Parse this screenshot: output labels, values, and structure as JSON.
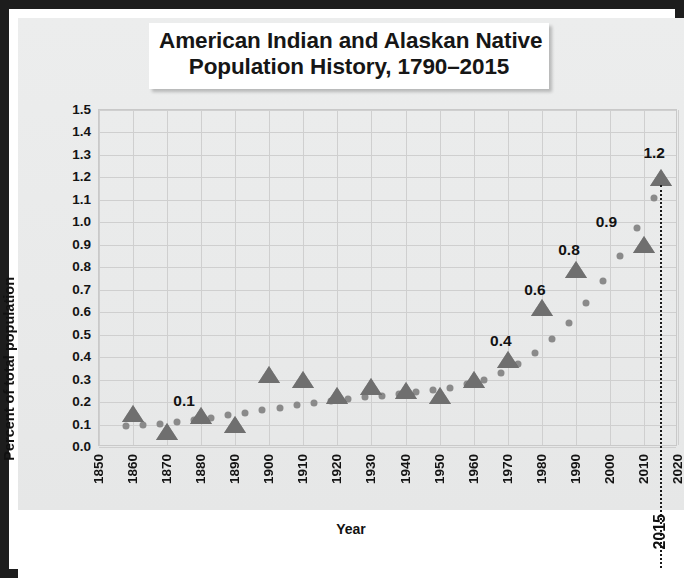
{
  "chart_data": {
    "type": "scatter",
    "title": "American Indian and Alaskan Native Population History, 1790–2015",
    "title_line1": "American Indian and Alaskan Native",
    "title_line2": "Population History, 1790–2015",
    "xlabel": "Year",
    "ylabel": "Percent of total population",
    "xlim": [
      1850,
      2020
    ],
    "ylim": [
      0.0,
      1.5
    ],
    "xtick_step": 10,
    "ytick_step": 0.1,
    "grid": true,
    "legend": "none",
    "marker_style": "triangle",
    "marker_color": "#6f6f6f",
    "trendline_style": "dotted",
    "trendline_color": "#8a8a8a",
    "xticks": [
      "1850",
      "1860",
      "1870",
      "1880",
      "1890",
      "1900",
      "1910",
      "1920",
      "1930",
      "1940",
      "1950",
      "1960",
      "1970",
      "1980",
      "1990",
      "2000",
      "2010",
      "2020"
    ],
    "yticks": [
      "1.5",
      "1.4",
      "1.3",
      "1.2",
      "1.1",
      "1.0",
      "0.9",
      "0.8",
      "0.7",
      "0.6",
      "0.5",
      "0.4",
      "0.3",
      "0.2",
      "0.1",
      "0.0"
    ],
    "x": [
      1860,
      1870,
      1880,
      1890,
      1900,
      1910,
      1920,
      1930,
      1940,
      1950,
      1960,
      1970,
      1980,
      1990,
      2010,
      2015
    ],
    "values": [
      0.14,
      0.06,
      0.13,
      0.09,
      0.31,
      0.29,
      0.22,
      0.26,
      0.24,
      0.22,
      0.29,
      0.38,
      0.61,
      0.78,
      0.89,
      1.19
    ],
    "points": [
      {
        "x": 1860,
        "y": 0.14
      },
      {
        "x": 1870,
        "y": 0.06
      },
      {
        "x": 1880,
        "y": 0.13
      },
      {
        "x": 1890,
        "y": 0.09
      },
      {
        "x": 1900,
        "y": 0.31
      },
      {
        "x": 1910,
        "y": 0.29
      },
      {
        "x": 1920,
        "y": 0.22
      },
      {
        "x": 1930,
        "y": 0.26
      },
      {
        "x": 1940,
        "y": 0.24
      },
      {
        "x": 1950,
        "y": 0.22
      },
      {
        "x": 1960,
        "y": 0.29
      },
      {
        "x": 1970,
        "y": 0.38
      },
      {
        "x": 1980,
        "y": 0.61
      },
      {
        "x": 1990,
        "y": 0.78
      },
      {
        "x": 2010,
        "y": 0.89
      },
      {
        "x": 2015,
        "y": 1.19
      }
    ],
    "data_labels": [
      {
        "text": "0.1",
        "x": 1875,
        "y": 0.205
      },
      {
        "text": "0.4",
        "x": 1968,
        "y": 0.47
      },
      {
        "text": "0.6",
        "x": 1978,
        "y": 0.7
      },
      {
        "text": "0.8",
        "x": 1988,
        "y": 0.875
      },
      {
        "text": "0.9",
        "x": 1999,
        "y": 1.0
      },
      {
        "text": "1.2",
        "x": 2013,
        "y": 1.31
      }
    ],
    "annotations": [
      {
        "name": "year-2015-marker-line",
        "label": "2015",
        "x": 2015,
        "style": "vertical dotted line"
      }
    ],
    "trendline_points": [
      {
        "x": 1858,
        "y": 0.092
      },
      {
        "x": 1863,
        "y": 0.098
      },
      {
        "x": 1868,
        "y": 0.104
      },
      {
        "x": 1873,
        "y": 0.112
      },
      {
        "x": 1878,
        "y": 0.121
      },
      {
        "x": 1883,
        "y": 0.131
      },
      {
        "x": 1888,
        "y": 0.142
      },
      {
        "x": 1893,
        "y": 0.153
      },
      {
        "x": 1898,
        "y": 0.164
      },
      {
        "x": 1903,
        "y": 0.175
      },
      {
        "x": 1908,
        "y": 0.186
      },
      {
        "x": 1913,
        "y": 0.196
      },
      {
        "x": 1918,
        "y": 0.205
      },
      {
        "x": 1923,
        "y": 0.214
      },
      {
        "x": 1928,
        "y": 0.222
      },
      {
        "x": 1933,
        "y": 0.229
      },
      {
        "x": 1938,
        "y": 0.236
      },
      {
        "x": 1943,
        "y": 0.244
      },
      {
        "x": 1948,
        "y": 0.253
      },
      {
        "x": 1953,
        "y": 0.264
      },
      {
        "x": 1958,
        "y": 0.279
      },
      {
        "x": 1963,
        "y": 0.3
      },
      {
        "x": 1968,
        "y": 0.329
      },
      {
        "x": 1973,
        "y": 0.368
      },
      {
        "x": 1978,
        "y": 0.418
      },
      {
        "x": 1983,
        "y": 0.48
      },
      {
        "x": 1988,
        "y": 0.554
      },
      {
        "x": 1993,
        "y": 0.641
      },
      {
        "x": 1998,
        "y": 0.74
      },
      {
        "x": 2003,
        "y": 0.851
      },
      {
        "x": 2008,
        "y": 0.974
      },
      {
        "x": 2013,
        "y": 1.108
      }
    ]
  }
}
